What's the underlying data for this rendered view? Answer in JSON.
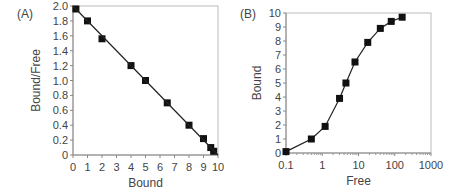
{
  "chart_data": [
    {
      "panel": "(A)",
      "type": "line",
      "title": "",
      "xlabel": "Bound",
      "ylabel": "Bound/Free",
      "xlim": [
        0,
        10
      ],
      "ylim": [
        0,
        2.0
      ],
      "xticks": [
        "0",
        "1",
        "2",
        "3",
        "4",
        "5",
        "6",
        "7",
        "8",
        "9",
        "10"
      ],
      "yticks": [
        "0",
        "0.2",
        "0.4",
        "0.6",
        "0.8",
        "1.0",
        "1.2",
        "1.4",
        "1.6",
        "1.8",
        "2.0"
      ],
      "grid": false,
      "series": [
        {
          "name": "data",
          "marker": "square",
          "x": [
            0.2,
            1.0,
            2.0,
            4.0,
            5.0,
            6.5,
            8.0,
            9.0,
            9.5,
            9.7
          ],
          "y": [
            1.96,
            1.8,
            1.56,
            1.2,
            1.0,
            0.7,
            0.4,
            0.22,
            0.1,
            0.05
          ]
        },
        {
          "name": "fit",
          "marker": "none",
          "x": [
            0,
            10
          ],
          "y": [
            2.0,
            0
          ]
        }
      ]
    },
    {
      "panel": "(B)",
      "type": "line",
      "title": "",
      "xlabel": "Free",
      "ylabel": "Bound",
      "xscale": "log",
      "xlim": [
        0.1,
        1000
      ],
      "ylim": [
        0,
        10
      ],
      "xticks": [
        "0.1",
        "1",
        "10",
        "100",
        "1000"
      ],
      "yticks": [
        "0",
        "1",
        "2",
        "3",
        "4",
        "5",
        "6",
        "7",
        "8",
        "9",
        "10"
      ],
      "grid": false,
      "series": [
        {
          "name": "data",
          "marker": "square",
          "x": [
            0.1,
            0.5,
            1.2,
            3.0,
            4.5,
            8.0,
            18,
            40,
            80,
            160
          ],
          "y": [
            0.1,
            1.0,
            1.9,
            3.9,
            5.0,
            6.5,
            7.9,
            8.9,
            9.4,
            9.7
          ]
        }
      ]
    }
  ]
}
